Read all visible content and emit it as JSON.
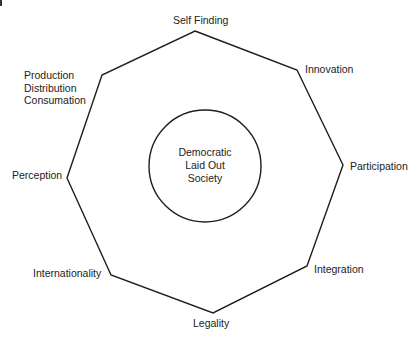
{
  "diagram": {
    "center": {
      "lines": [
        "Democratic",
        "Laid Out",
        "Society"
      ]
    },
    "nodes": [
      {
        "id": "self-finding",
        "label": "Self Finding",
        "vertex": [
          195,
          31
        ]
      },
      {
        "id": "innovation",
        "label": "Innovation",
        "vertex": [
          297,
          70
        ]
      },
      {
        "id": "participation",
        "label": "Participation",
        "vertex": [
          343,
          165
        ]
      },
      {
        "id": "integration",
        "label": "Integration",
        "vertex": [
          307,
          266
        ]
      },
      {
        "id": "legality",
        "label": "Legality",
        "vertex": [
          213,
          313
        ]
      },
      {
        "id": "internationality",
        "label": "Internationality",
        "vertex": [
          111,
          275
        ]
      },
      {
        "id": "perception",
        "label": "Perception",
        "vertex": [
          67,
          178
        ]
      },
      {
        "id": "production",
        "label_lines": [
          "Production",
          "Distribution",
          "Consumation"
        ],
        "vertex": [
          102,
          75
        ]
      }
    ],
    "colors": {
      "stroke": "#1e1e1e",
      "background": "#ffffff"
    }
  }
}
